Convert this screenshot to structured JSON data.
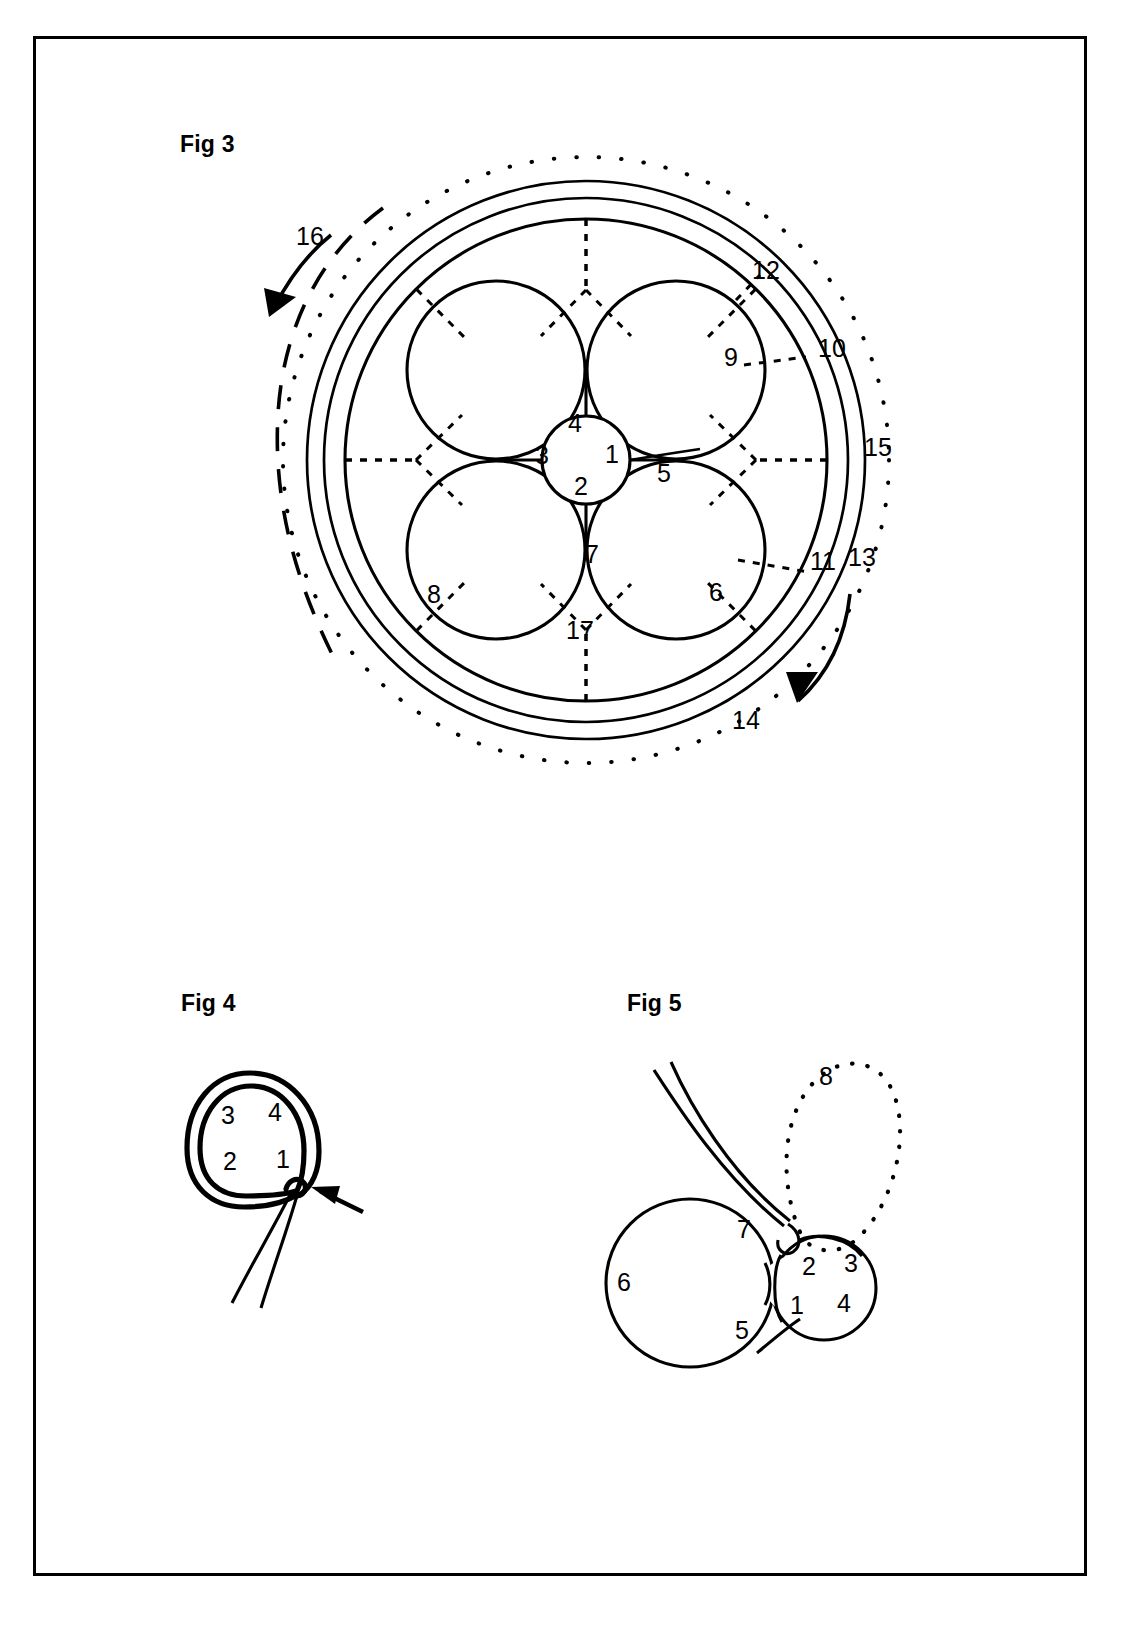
{
  "sheet": {
    "background_color": "#ffffff",
    "line_color": "#000000",
    "border": "rectangular frame"
  },
  "figures": [
    {
      "id": "fig3",
      "caption": "Fig 3",
      "description": "Cross-section of a quatrefoil cable core inside two concentric sheath rings with a dotted outer boundary",
      "labels": [
        {
          "ref": "1",
          "x": 612,
          "y": 463,
          "note": "core element right"
        },
        {
          "ref": "2",
          "x": 581,
          "y": 495,
          "note": "core element bottom"
        },
        {
          "ref": "3",
          "x": 542,
          "y": 464,
          "note": "core element left"
        },
        {
          "ref": "4",
          "x": 575,
          "y": 432,
          "note": "core element top"
        },
        {
          "ref": "5",
          "x": 664,
          "y": 482,
          "note": "right junction"
        },
        {
          "ref": "6",
          "x": 716,
          "y": 601,
          "note": "lower-right petal"
        },
        {
          "ref": "7",
          "x": 592,
          "y": 563,
          "note": "lower junction"
        },
        {
          "ref": "8",
          "x": 434,
          "y": 603,
          "note": "lower-left petal"
        },
        {
          "ref": "9",
          "x": 731,
          "y": 366,
          "note": "upper-right petal"
        },
        {
          "ref": "10",
          "x": 818,
          "y": 357,
          "note": "inner sheath leader right"
        },
        {
          "ref": "11",
          "x": 822,
          "y": 564,
          "note": "inner sheath leader lower-right"
        },
        {
          "ref": "12",
          "x": 763,
          "y": 271,
          "note": "inner sheath leader upper-right"
        },
        {
          "ref": "13",
          "x": 861,
          "y": 560,
          "note": "outer sheath"
        },
        {
          "ref": "14",
          "x": 744,
          "y": 723,
          "note": "outer sheath bottom"
        },
        {
          "ref": "15",
          "x": 875,
          "y": 448,
          "note": "dotted outer boundary"
        },
        {
          "ref": "16",
          "x": 305,
          "y": 238,
          "note": "counter-rotation arrow"
        },
        {
          "ref": "17",
          "x": 578,
          "y": 630,
          "note": "interstice"
        }
      ]
    },
    {
      "id": "fig4",
      "caption": "Fig 4",
      "description": "Small double-walled ring with four numbered quadrants and a tail emerging at bottom right, indicated by a solid arrow",
      "labels": [
        {
          "ref": "3",
          "x": 228,
          "y": 1116
        },
        {
          "ref": "4",
          "x": 275,
          "y": 1113
        },
        {
          "ref": "2",
          "x": 230,
          "y": 1162
        },
        {
          "ref": "1",
          "x": 283,
          "y": 1160
        }
      ]
    },
    {
      "id": "fig5",
      "caption": "Fig 5",
      "description": "Large circle adjacent to a small four-quadrant circle, a double-line strand entering the small circle, and a dotted loop above",
      "labels": [
        {
          "ref": "6",
          "x": 624,
          "y": 1282
        },
        {
          "ref": "5",
          "x": 742,
          "y": 1331
        },
        {
          "ref": "7",
          "x": 744,
          "y": 1230
        },
        {
          "ref": "8",
          "x": 826,
          "y": 1077
        },
        {
          "ref": "2",
          "x": 809,
          "y": 1267
        },
        {
          "ref": "3",
          "x": 848,
          "y": 1264
        },
        {
          "ref": "1",
          "x": 797,
          "y": 1306
        },
        {
          "ref": "4",
          "x": 841,
          "y": 1304
        }
      ]
    }
  ]
}
